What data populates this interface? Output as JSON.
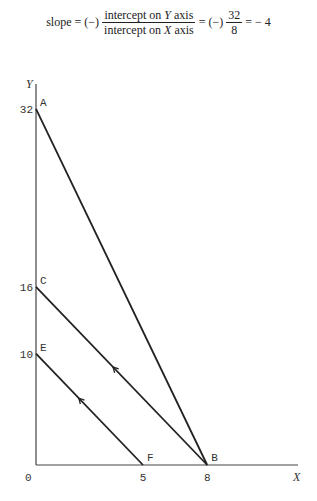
{
  "formula": {
    "lhs": "slope = (−)",
    "frac1_num_a": "intercept on ",
    "frac1_num_var": "Y",
    "frac1_num_b": " axis",
    "frac1_den_a": "intercept on ",
    "frac1_den_var": "X",
    "frac1_den_b": " axis",
    "mid": "= (−)",
    "frac2_num": "32",
    "frac2_den": "8",
    "rhs": "= − 4"
  },
  "diagram": {
    "axes": {
      "x_label": "X",
      "y_label": "Y",
      "origin_label": "0",
      "x_max": 10.5,
      "y_max": 35
    },
    "y_ticks": [
      {
        "value": 32,
        "label": "32"
      },
      {
        "value": 16,
        "label": "16"
      },
      {
        "value": 10,
        "label": "10"
      }
    ],
    "x_ticks": [
      {
        "value": 5,
        "label": "5"
      },
      {
        "value": 8,
        "label": "8"
      }
    ],
    "points": [
      {
        "name": "A",
        "x": 0,
        "y": 32
      },
      {
        "name": "C",
        "x": 0,
        "y": 16
      },
      {
        "name": "E",
        "x": 0,
        "y": 10
      },
      {
        "name": "F",
        "x": 5,
        "y": 0
      },
      {
        "name": "B",
        "x": 8,
        "y": 0
      }
    ],
    "lines": [
      {
        "from": "A",
        "to": "B",
        "arrow": false
      },
      {
        "from": "C",
        "to": "B",
        "arrow": true,
        "arrow_at": 0.45
      },
      {
        "from": "E",
        "to": "F",
        "arrow": true,
        "arrow_at": 0.4
      }
    ]
  }
}
